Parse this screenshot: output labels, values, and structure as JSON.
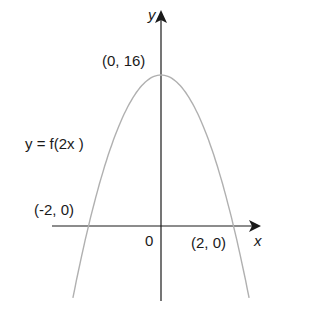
{
  "chart_data": {
    "type": "line",
    "title": "",
    "xlabel": "x",
    "ylabel": "y",
    "curve_label": "y = f(2x )",
    "equation_implied": "y = 16 - 4x^2",
    "key_points": [
      {
        "label": "(0, 16)",
        "x": 0,
        "y": 16,
        "role": "vertex"
      },
      {
        "label": "(-2, 0)",
        "x": -2,
        "y": 0,
        "role": "x-intercept"
      },
      {
        "label": "(2, 0)",
        "x": 2,
        "y": 0,
        "role": "x-intercept"
      }
    ],
    "origin_label": "0",
    "x": [
      -2.4,
      -2,
      -1.5,
      -1,
      -0.5,
      0,
      0.5,
      1,
      1.5,
      2,
      2.4
    ],
    "y": [
      -7.04,
      0,
      7,
      12,
      15,
      16,
      15,
      12,
      7,
      0,
      -7.04
    ],
    "grid": false,
    "curve_color": "#b0b0b0",
    "axis_color": "#1a1a1a"
  },
  "labels": {
    "y_axis": "y",
    "x_axis": "x",
    "vertex": "(0, 16)",
    "curve": "y = f(2x )",
    "left_root": "(-2, 0)",
    "right_root": "(2, 0)",
    "origin": "0"
  }
}
